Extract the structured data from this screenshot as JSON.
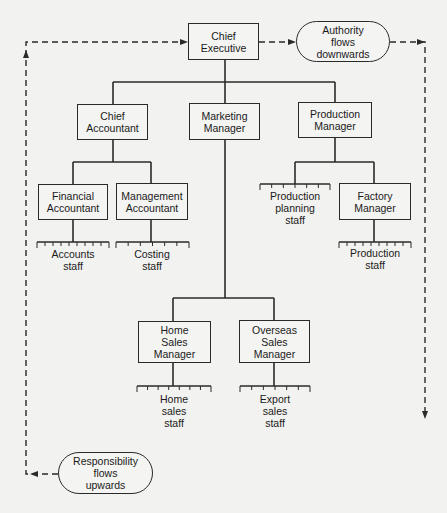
{
  "colors": {
    "line": "#2a2a2a",
    "background": "#f2f2f0",
    "box_fill": "#f4f4f2"
  },
  "flows": {
    "authority": {
      "label": "Authority\nflows\ndownwards",
      "direction": "down"
    },
    "responsibility": {
      "label": "Responsibility\nflows\nupwards",
      "direction": "up"
    }
  },
  "nodes": {
    "chief_executive": {
      "label": "Chief\nExecutive"
    },
    "chief_accountant": {
      "label": "Chief\nAccountant"
    },
    "marketing_manager": {
      "label": "Marketing\nManager"
    },
    "production_manager": {
      "label": "Production\nManager"
    },
    "financial_accountant": {
      "label": "Financial\nAccountant"
    },
    "management_accountant": {
      "label": "Management\nAccountant"
    },
    "factory_manager": {
      "label": "Factory\nManager"
    },
    "home_sales_manager": {
      "label": "Home\nSales\nManager"
    },
    "overseas_sales_manager": {
      "label": "Overseas\nSales\nManager"
    }
  },
  "staff": {
    "accounts": {
      "label": "Accounts\nstaff",
      "reports_to": "Financial Accountant"
    },
    "costing": {
      "label": "Costing\nstaff",
      "reports_to": "Management Accountant"
    },
    "production_planning": {
      "label": "Production\nplanning\nstaff",
      "reports_to": "Production Manager"
    },
    "production": {
      "label": "Production\nstaff",
      "reports_to": "Factory Manager"
    },
    "home_sales": {
      "label": "Home\nsales\nstaff",
      "reports_to": "Home Sales Manager"
    },
    "export_sales": {
      "label": "Export\nsales\nstaff",
      "reports_to": "Overseas Sales Manager"
    }
  },
  "hierarchy": [
    {
      "parent": "Chief Executive",
      "children": [
        "Chief Accountant",
        "Marketing Manager",
        "Production Manager"
      ]
    },
    {
      "parent": "Chief Accountant",
      "children": [
        "Financial Accountant",
        "Management Accountant"
      ]
    },
    {
      "parent": "Marketing Manager",
      "children": [
        "Home Sales Manager",
        "Overseas Sales Manager"
      ]
    },
    {
      "parent": "Production Manager",
      "children": [
        "Production planning staff",
        "Factory Manager"
      ]
    }
  ]
}
